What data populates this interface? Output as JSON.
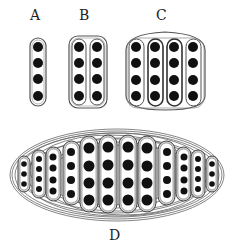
{
  "labels": {
    "a": "A",
    "b": "B",
    "c": "C",
    "d": "D"
  },
  "colors": {
    "dot": "#111111",
    "outline": "#555555",
    "shade": "#bdbdbd",
    "background": "#ffffff"
  },
  "panels": {
    "A": {
      "columns": 1,
      "dots_per_column": 4
    },
    "B": {
      "columns": 2,
      "dots_per_column": 4,
      "enclosures": 1
    },
    "C": {
      "columns": 4,
      "dots_per_column": 4,
      "enclosures": 1
    },
    "D": {
      "columns": 12,
      "dots_per_column": [
        3,
        4,
        4,
        4,
        4,
        4,
        4,
        4,
        4,
        4,
        4,
        3
      ],
      "enclosures": "nested ellipses"
    }
  }
}
